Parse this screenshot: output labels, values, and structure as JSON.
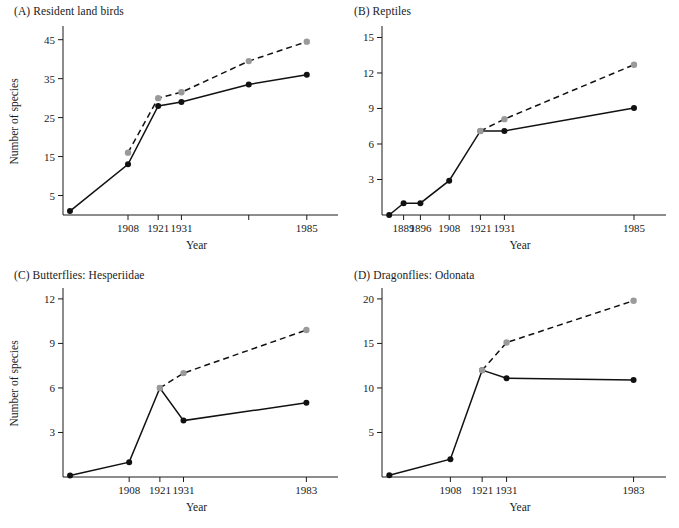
{
  "figure": {
    "axis_title_x": "Year",
    "axis_title_y": "Number of species",
    "legend": {
      "observed_series_name": "Observed (solid, black points)",
      "estimated_series_name": "Estimated total (dashed, gray points)"
    }
  },
  "panels": {
    "A": {
      "title": "(A) Resident land birds",
      "ylabel": "Number of species",
      "xlabel": "Year"
    },
    "B": {
      "title": "(B) Reptiles",
      "ylabel": "",
      "xlabel": "Year"
    },
    "C": {
      "title": "(C) Butterflies: Hesperiidae",
      "ylabel": "Number of species",
      "xlabel": "Year"
    },
    "D": {
      "title": "(D) Dragonflies: Odonata",
      "ylabel": "",
      "xlabel": "Year"
    }
  },
  "chart_data": [
    {
      "panel": "A",
      "type": "line",
      "title": "(A) Resident land birds",
      "xlabel": "Year",
      "ylabel": "Number of species",
      "xlim": [
        1880,
        1995
      ],
      "ylim": [
        0,
        48
      ],
      "yticks": [
        5,
        15,
        25,
        35,
        45
      ],
      "ytick_labels": [
        "5",
        "15",
        "25",
        "35",
        "45"
      ],
      "xticks": [
        1908,
        1921,
        1931,
        1960,
        1985
      ],
      "xtick_labels": [
        "1908",
        "1921",
        "1931",
        "",
        "1985"
      ],
      "grid": false,
      "legend_position": "none",
      "series": [
        {
          "name": "Observed",
          "style": "solid",
          "marker_color": "#111111",
          "x": [
            1883,
            1908,
            1921,
            1931,
            1960,
            1985
          ],
          "values": [
            1,
            13,
            28,
            29,
            33.5,
            36
          ]
        },
        {
          "name": "Estimated total",
          "style": "dashed",
          "marker_color": "#9a9a9a",
          "x": [
            1908,
            1921,
            1931,
            1960,
            1985
          ],
          "values": [
            16,
            30,
            31.5,
            39.5,
            44.5
          ]
        }
      ]
    },
    {
      "panel": "B",
      "type": "line",
      "title": "(B) Reptiles",
      "xlabel": "Year",
      "ylabel": "",
      "xlim": [
        1880,
        1995
      ],
      "ylim": [
        0,
        15.8
      ],
      "yticks": [
        3,
        6,
        9,
        12,
        15
      ],
      "ytick_labels": [
        "3",
        "6",
        "9",
        "12",
        "15"
      ],
      "xticks": [
        1889,
        1896,
        1908,
        1921,
        1931,
        1985
      ],
      "xtick_labels": [
        "1889",
        "1896",
        "1908",
        "1921",
        "1931",
        "1985"
      ],
      "grid": false,
      "legend_position": "none",
      "series": [
        {
          "name": "Observed",
          "style": "solid",
          "marker_color": "#111111",
          "x": [
            1883,
            1889,
            1896,
            1908,
            1921,
            1931,
            1985
          ],
          "values": [
            0,
            1,
            1,
            2.9,
            7.1,
            7.1,
            9.05
          ]
        },
        {
          "name": "Estimated total",
          "style": "dashed",
          "marker_color": "#9a9a9a",
          "x": [
            1921,
            1931,
            1985
          ],
          "values": [
            7.1,
            8.1,
            12.7
          ]
        }
      ]
    },
    {
      "panel": "C",
      "type": "line",
      "title": "(C) Butterflies: Hesperiidae",
      "xlabel": "Year",
      "ylabel": "Number of species",
      "xlim": [
        1880,
        1993
      ],
      "ylim": [
        0,
        12.6
      ],
      "yticks": [
        3,
        6,
        9,
        12
      ],
      "ytick_labels": [
        "3",
        "6",
        "9",
        "12"
      ],
      "xticks": [
        1908,
        1921,
        1931,
        1983
      ],
      "xtick_labels": [
        "1908",
        "1921",
        "1931",
        "1983"
      ],
      "grid": false,
      "legend_position": "none",
      "series": [
        {
          "name": "Observed",
          "style": "solid",
          "marker_color": "#111111",
          "x": [
            1883,
            1908,
            1921,
            1931,
            1983
          ],
          "values": [
            0.1,
            1.0,
            6.0,
            3.8,
            5.0
          ]
        },
        {
          "name": "Estimated total",
          "style": "dashed",
          "marker_color": "#9a9a9a",
          "x": [
            1921,
            1931,
            1983
          ],
          "values": [
            6.0,
            7.0,
            9.9
          ]
        }
      ]
    },
    {
      "panel": "D",
      "type": "line",
      "title": "(D) Dragonflies: Odonata",
      "xlabel": "Year",
      "ylabel": "",
      "xlim": [
        1880,
        1993
      ],
      "ylim": [
        0,
        21
      ],
      "yticks": [
        5,
        10,
        15,
        20
      ],
      "ytick_labels": [
        "5",
        "10",
        "15",
        "20"
      ],
      "xticks": [
        1908,
        1921,
        1931,
        1983
      ],
      "xtick_labels": [
        "1908",
        "1921",
        "1931",
        "1983"
      ],
      "grid": false,
      "legend_position": "none",
      "series": [
        {
          "name": "Observed",
          "style": "solid",
          "marker_color": "#111111",
          "x": [
            1883,
            1908,
            1921,
            1931,
            1983
          ],
          "values": [
            0.2,
            2.0,
            12.0,
            11.1,
            10.9
          ]
        },
        {
          "name": "Estimated total",
          "style": "dashed",
          "marker_color": "#9a9a9a",
          "x": [
            1921,
            1931,
            1983
          ],
          "values": [
            12.0,
            15.1,
            19.8
          ]
        }
      ]
    }
  ]
}
